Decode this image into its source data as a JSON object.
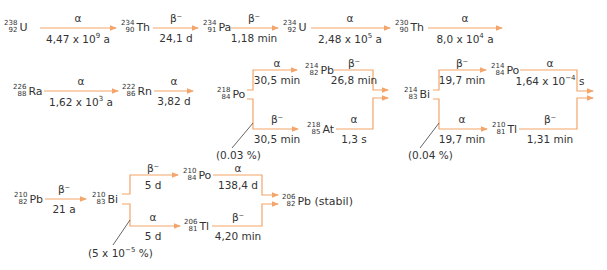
{
  "colors": {
    "arrow": "#f4a56b",
    "text": "#333333",
    "leader": "#555555"
  },
  "nuclides": {
    "u238": {
      "mass": "238",
      "z": "92",
      "symbol": "U"
    },
    "th234": {
      "mass": "234",
      "z": "90",
      "symbol": "Th"
    },
    "pa234": {
      "mass": "234",
      "z": "91",
      "symbol": "Pa"
    },
    "u234": {
      "mass": "234",
      "z": "92",
      "symbol": "U"
    },
    "th230": {
      "mass": "230",
      "z": "90",
      "symbol": "Th"
    },
    "ra226": {
      "mass": "226",
      "z": "88",
      "symbol": "Ra"
    },
    "rn222": {
      "mass": "222",
      "z": "86",
      "symbol": "Rn"
    },
    "po218": {
      "mass": "218",
      "z": "84",
      "symbol": "Po"
    },
    "pb214": {
      "mass": "214",
      "z": "82",
      "symbol": "Pb"
    },
    "at218": {
      "mass": "218",
      "z": "85",
      "symbol": "At"
    },
    "bi214": {
      "mass": "214",
      "z": "83",
      "symbol": "Bi"
    },
    "po214": {
      "mass": "214",
      "z": "84",
      "symbol": "Po"
    },
    "tl210": {
      "mass": "210",
      "z": "81",
      "symbol": "Tl"
    },
    "pb210": {
      "mass": "210",
      "z": "82",
      "symbol": "Pb"
    },
    "bi210": {
      "mass": "210",
      "z": "83",
      "symbol": "Bi"
    },
    "po210": {
      "mass": "210",
      "z": "84",
      "symbol": "Po"
    },
    "tl206": {
      "mass": "206",
      "z": "81",
      "symbol": "Tl"
    },
    "pb206": {
      "mass": "206",
      "z": "82",
      "symbol": "Pb (stabil)"
    }
  },
  "decays": {
    "u238_th234": {
      "mode": "α",
      "halflife_base": "4,47 x 10",
      "halflife_exp": "9",
      "halflife_unit": " a"
    },
    "th234_pa234": {
      "mode": "β⁻",
      "halflife": "24,1 d"
    },
    "pa234_u234": {
      "mode": "β⁻",
      "halflife": "1,18 min"
    },
    "u234_th230": {
      "mode": "α",
      "halflife_base": "2,48 x 10",
      "halflife_exp": "5",
      "halflife_unit": " a"
    },
    "th230_ra226": {
      "mode": "α",
      "halflife_base": "8,0 x 10",
      "halflife_exp": "4",
      "halflife_unit": " a"
    },
    "ra226_rn222": {
      "mode": "α",
      "halflife_base": "1,62 x 10",
      "halflife_exp": "3",
      "halflife_unit": " a"
    },
    "rn222_po218": {
      "mode": "α",
      "halflife": "3,82 d"
    },
    "po218_pb214": {
      "mode": "α",
      "halflife": "30,5 min"
    },
    "po218_at218": {
      "mode": "β⁻",
      "halflife": "30,5 min",
      "branch": "(0.03 %)"
    },
    "pb214_bi214": {
      "mode": "β⁻",
      "halflife": "26,8 min"
    },
    "at218_bi214": {
      "mode": "α",
      "halflife": "1,3 s"
    },
    "bi214_po214": {
      "mode": "β⁻",
      "halflife": "19,7 min"
    },
    "bi214_tl210": {
      "mode": "α",
      "halflife": "19,7 min",
      "branch": "(0.04 %)"
    },
    "po214_pb210": {
      "mode": "α",
      "halflife_base": "1,64 x 10",
      "halflife_exp": "−4",
      "halflife_unit": " s"
    },
    "tl210_pb210": {
      "mode": "β⁻",
      "halflife": "1,31 min"
    },
    "pb210_bi210": {
      "mode": "β⁻",
      "halflife": "21 a"
    },
    "bi210_po210": {
      "mode": "β⁻",
      "halflife": "5 d"
    },
    "bi210_tl206": {
      "mode": "α",
      "halflife": "5 d",
      "branch_base": "(5 x 10",
      "branch_exp": "−5",
      "branch_unit": " %)"
    },
    "po210_pb206": {
      "mode": "α",
      "halflife": "138,4 d"
    },
    "tl206_pb206": {
      "mode": "β⁻",
      "halflife": "4,20 min"
    }
  }
}
